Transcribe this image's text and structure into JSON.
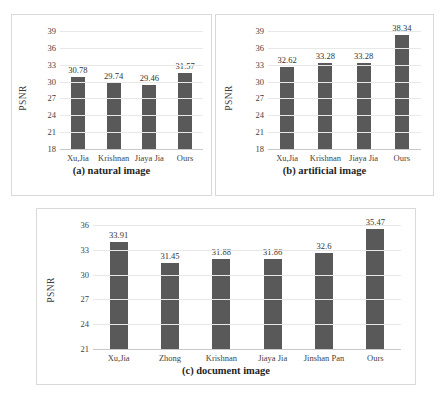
{
  "figure": {
    "bar_color": "#595959",
    "grid_color": "#e8e8e8",
    "panel_border_color": "#d9d9d9"
  },
  "chart_data": [
    {
      "type": "bar",
      "panel": "a",
      "title": "(a) natural image",
      "xlabel": "",
      "ylabel": "PSNR",
      "categories": [
        "Xu,Jia",
        "Krishnan",
        "Jiaya Jia",
        "Ours"
      ],
      "values": [
        30.78,
        29.74,
        29.46,
        31.57
      ],
      "value_labels": [
        "30.78",
        "29.74",
        "29.46",
        "31.57"
      ],
      "yticks": [
        18,
        21,
        24,
        27,
        30,
        33,
        36,
        39
      ],
      "ytick_labels": [
        "18",
        "21",
        "24",
        "27",
        "30",
        "33",
        "36",
        "39"
      ],
      "ylim": [
        18,
        39
      ],
      "grid": true,
      "legend": "none"
    },
    {
      "type": "bar",
      "panel": "b",
      "title": "(b) artificial image",
      "xlabel": "",
      "ylabel": "PSNR",
      "categories": [
        "Xu,Jia",
        "Krishnan",
        "Jiaya Jia",
        "Ours"
      ],
      "values": [
        32.62,
        33.28,
        33.28,
        38.34
      ],
      "value_labels": [
        "32.62",
        "33.28",
        "33.28",
        "38.34"
      ],
      "yticks": [
        18,
        21,
        24,
        27,
        30,
        33,
        36,
        39
      ],
      "ytick_labels": [
        "18",
        "21",
        "24",
        "27",
        "30",
        "33",
        "36",
        "39"
      ],
      "ylim": [
        18,
        39
      ],
      "grid": true,
      "legend": "none"
    },
    {
      "type": "bar",
      "panel": "c",
      "title": "(c) document image",
      "xlabel": "",
      "ylabel": "PSNR",
      "categories": [
        "Xu,Jia",
        "Zhong",
        "Krishnan",
        "Jiaya Jia",
        "Jinshan Pan",
        "Ours"
      ],
      "values": [
        33.91,
        31.45,
        31.88,
        31.86,
        32.6,
        35.47
      ],
      "value_labels": [
        "33.91",
        "31.45",
        "31.88",
        "31.86",
        "32.6",
        "35.47"
      ],
      "yticks": [
        21,
        24,
        27,
        30,
        33,
        36
      ],
      "ytick_labels": [
        "21",
        "24",
        "27",
        "30",
        "33",
        "36"
      ],
      "ylim": [
        21,
        36
      ],
      "grid": true,
      "legend": "none"
    }
  ]
}
